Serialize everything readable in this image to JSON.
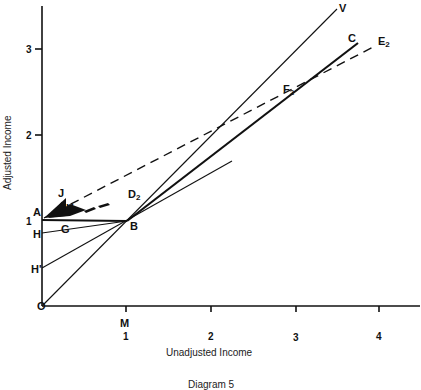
{
  "diagram": {
    "caption": "Diagram 5",
    "x_axis_label": "Unadjusted Income",
    "y_axis_label": "Adjusted Income",
    "x_ticks": [
      "1",
      "2",
      "3",
      "4"
    ],
    "y_ticks": [
      "1",
      "2",
      "3"
    ],
    "points": {
      "origin": "O",
      "A": "A",
      "B": "B",
      "C": "C",
      "G": "G",
      "H": "H",
      "H_prime": "H'",
      "J": "J",
      "K": "K",
      "M": "M",
      "V": "V",
      "D": "D",
      "D_sub": "2",
      "E": "E",
      "E_sub": "2",
      "F": "F",
      "F_sub": "2"
    },
    "lines": [
      {
        "name": "OV",
        "from": "O",
        "to": "V",
        "style": "solid-thin"
      },
      {
        "name": "BC",
        "from": "B",
        "to": "C",
        "style": "solid-thick"
      },
      {
        "name": "AE2",
        "from": "A",
        "to": "E2",
        "style": "dashed"
      },
      {
        "name": "AB",
        "from": "A",
        "to": "B",
        "style": "solid-thick"
      },
      {
        "name": "HB",
        "from": "H",
        "to": "B",
        "style": "solid-thin"
      },
      {
        "name": "H'B",
        "from": "H'",
        "to": "beyond B",
        "style": "solid-thin"
      }
    ]
  }
}
